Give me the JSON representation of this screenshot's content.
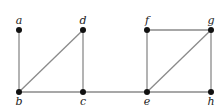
{
  "graph": {
    "nodes": [
      {
        "id": "a",
        "label": "a",
        "x": 19,
        "y": 30,
        "label_pos": "above"
      },
      {
        "id": "d",
        "label": "d",
        "x": 83,
        "y": 30,
        "label_pos": "above"
      },
      {
        "id": "b",
        "label": "b",
        "x": 19,
        "y": 92,
        "label_pos": "below"
      },
      {
        "id": "c",
        "label": "c",
        "x": 83,
        "y": 92,
        "label_pos": "below"
      },
      {
        "id": "f",
        "label": "f",
        "x": 147,
        "y": 30,
        "label_pos": "above"
      },
      {
        "id": "g",
        "label": "g",
        "x": 211,
        "y": 30,
        "label_pos": "above"
      },
      {
        "id": "e",
        "label": "e",
        "x": 147,
        "y": 92,
        "label_pos": "below"
      },
      {
        "id": "h",
        "label": "h",
        "x": 211,
        "y": 92,
        "label_pos": "below"
      }
    ],
    "edges": [
      [
        "a",
        "b"
      ],
      [
        "b",
        "d"
      ],
      [
        "d",
        "c"
      ],
      [
        "b",
        "c"
      ],
      [
        "c",
        "e"
      ],
      [
        "e",
        "f"
      ],
      [
        "f",
        "g"
      ],
      [
        "e",
        "g"
      ],
      [
        "g",
        "h"
      ],
      [
        "e",
        "h"
      ]
    ],
    "colors": {
      "edge": "#8a8a8a",
      "node": "#111111",
      "label": "#222222"
    }
  }
}
